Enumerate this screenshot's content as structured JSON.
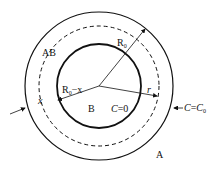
{
  "diagram": {
    "regions": {
      "outer": "A",
      "shell": "AB",
      "core": "B"
    },
    "labels": {
      "radius_outer": "R",
      "radius_outer_sub": "0",
      "radius_core": "R",
      "radius_core_sub": "0",
      "radius_core_suffix": "−x",
      "r": "r",
      "x": "x",
      "core_condition": "C=0",
      "surface_condition": "C=C",
      "surface_condition_sub": "0"
    },
    "colors": {
      "stroke": "#111111",
      "background": "#ffffff"
    }
  }
}
